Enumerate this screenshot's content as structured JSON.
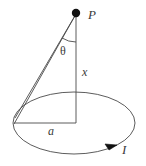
{
  "figure": {
    "type": "physics-diagram",
    "stroke_color": "#4a4a4a",
    "background_color": "#ffffff",
    "labels": {
      "point": "P",
      "angle": "θ",
      "axial_distance": "x",
      "radius": "a",
      "current": "I"
    },
    "geometry": {
      "loop_center": {
        "x": 74,
        "y": 123
      },
      "loop_radius_x": 61,
      "loop_radius_y": 31,
      "point_p": {
        "x": 76,
        "y": 13
      },
      "loop_left_edge": {
        "x": 14,
        "y": 123
      },
      "axis_foot": {
        "x": 76,
        "y": 119
      },
      "current_arrow": {
        "x": 112,
        "y": 146
      }
    }
  }
}
